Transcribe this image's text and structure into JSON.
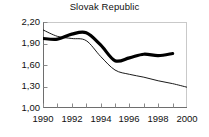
{
  "chart_data": {
    "type": "line",
    "title": "Slovak Republic",
    "xlabel": "",
    "ylabel": "",
    "xlim": [
      1990,
      2000
    ],
    "ylim": [
      1.0,
      2.2
    ],
    "grid": false,
    "legend": "none",
    "x_tick_labels": [
      "1990",
      "1992",
      "1994",
      "1996",
      "1998",
      "2000"
    ],
    "x_tick_values": [
      1990,
      1992,
      1994,
      1996,
      1998,
      2000
    ],
    "x_minor_ticks": [
      1991,
      1993,
      1995,
      1997,
      1999
    ],
    "y_tick_labels": [
      "1,00",
      "1,30",
      "1,60",
      "1,90",
      "2,20"
    ],
    "y_tick_values": [
      1.0,
      1.3,
      1.6,
      1.9,
      2.2
    ],
    "decimal_separator": ",",
    "x": [
      1990,
      1991,
      1992,
      1993,
      1994,
      1995,
      1996,
      1997,
      1998,
      1999,
      2000
    ],
    "series": [
      {
        "name": "thick-line",
        "style": "solid",
        "width": 3.2,
        "color": "#000000",
        "x": [
          1990,
          1991,
          1992,
          1993,
          1994,
          1995,
          1996,
          1997,
          1998,
          1999
        ],
        "values": [
          1.97,
          1.96,
          2.03,
          2.05,
          1.88,
          1.66,
          1.7,
          1.75,
          1.73,
          1.76
        ]
      },
      {
        "name": "thin-line",
        "style": "solid",
        "width": 0.9,
        "color": "#000000",
        "x": [
          1990,
          1991,
          1992,
          1993,
          1994,
          1995,
          1996,
          1997,
          1998,
          1999,
          2000
        ],
        "values": [
          2.09,
          2.0,
          1.97,
          1.94,
          1.72,
          1.53,
          1.47,
          1.43,
          1.38,
          1.34,
          1.29
        ]
      }
    ]
  },
  "axes": {
    "top_border_color": "#c9c9c9",
    "axis_color": "#6e6e6e",
    "tick_color": "#8a8a8a"
  }
}
